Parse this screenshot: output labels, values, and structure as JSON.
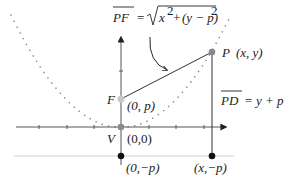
{
  "diagram": {
    "formula_pf": {
      "lhs": "PF",
      "eq": "=",
      "radicand": "x² + (y − p)²",
      "radicand_parts": [
        "x",
        "2",
        "+",
        "(y − p)",
        "2"
      ]
    },
    "formula_pd": {
      "lhs": "PD",
      "rhs": "= y + p"
    },
    "points": {
      "P": {
        "name": "P",
        "coords": "(x, y)"
      },
      "F": {
        "name": "F",
        "coords": "(0, p)"
      },
      "V": {
        "name": "V",
        "coords": "(0,0)"
      },
      "D0": {
        "coords": "(0,−p)"
      },
      "D": {
        "coords": "(x,−p)"
      }
    },
    "colors": {
      "axis": "#555555",
      "parabola": "#888888",
      "directrix": "#cccccc",
      "focus_point": "#c8c8c8",
      "vertex_point": "#8a8a8a",
      "directrix_points": "#111111",
      "p_point": "#888888"
    }
  }
}
